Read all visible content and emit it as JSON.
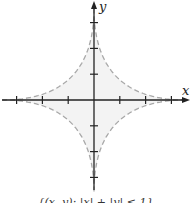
{
  "figure": {
    "type": "region-plot",
    "x_axis_label": "x",
    "y_axis_label": "y",
    "caption": "{(x, y): |x| + |y| ≤ 1}",
    "tick_values_x": [
      -3,
      -2,
      -1,
      1,
      2,
      3
    ],
    "tick_values_y": [
      -3,
      -2,
      -1,
      1,
      2,
      3
    ],
    "boundary_style": "dashed",
    "colors": {
      "axis": "#222222",
      "boundary": "#a8a8a8",
      "region_fill": "#f3f3f3",
      "background": "#ffffff"
    }
  }
}
